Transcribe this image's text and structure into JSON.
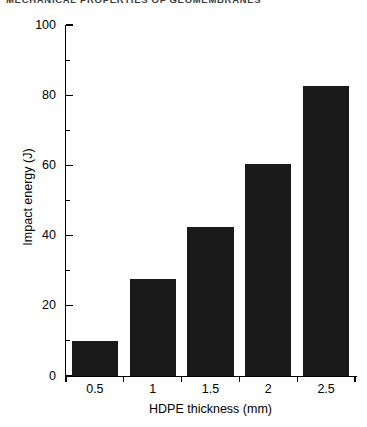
{
  "page": {
    "running_header": "MECHANICAL PROPERTIES OF GEOMEMBRANES"
  },
  "chart_data": {
    "type": "bar",
    "title": "",
    "xlabel": "HDPE thickness (mm)",
    "ylabel": "Impact energy (J)",
    "categories": [
      "0.5",
      "1",
      "1.5",
      "2",
      "2.5"
    ],
    "values": [
      10,
      27.5,
      42.5,
      60.5,
      82.5
    ],
    "ylim": [
      0,
      100
    ],
    "yticks": [
      0,
      20,
      40,
      60,
      80,
      100
    ],
    "yticks_minor": [
      10,
      30,
      50,
      70,
      90
    ],
    "xticks": [
      "0.5",
      "1",
      "1.5",
      "2",
      "2.5"
    ],
    "grid": false,
    "legend": "none",
    "bar_color": "#1a1a1a",
    "axis_color": "#000000",
    "background_color": "#ffffff"
  }
}
